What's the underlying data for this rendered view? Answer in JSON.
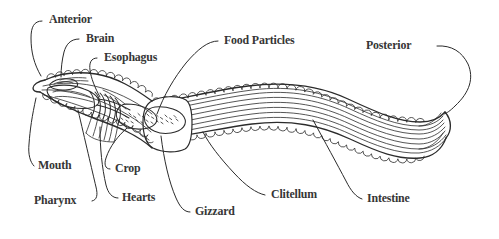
{
  "figure": {
    "style": "black-and-white line drawing",
    "background_color": "#ffffff",
    "ink_color": "#363636",
    "line_color": "#2b2b2b"
  },
  "labels": [
    {
      "id": "anterior",
      "text": "Anterior"
    },
    {
      "id": "brain",
      "text": "Brain"
    },
    {
      "id": "esophagus",
      "text": "Esophagus"
    },
    {
      "id": "food-particles",
      "text": "Food Particles"
    },
    {
      "id": "posterior",
      "text": "Posterior"
    },
    {
      "id": "mouth",
      "text": "Mouth"
    },
    {
      "id": "pharynx",
      "text": "Pharynx"
    },
    {
      "id": "crop",
      "text": "Crop"
    },
    {
      "id": "hearts",
      "text": "Hearts"
    },
    {
      "id": "gizzard",
      "text": "Gizzard"
    },
    {
      "id": "clitellum",
      "text": "Clitellum"
    },
    {
      "id": "intestine",
      "text": "Intestine"
    }
  ]
}
